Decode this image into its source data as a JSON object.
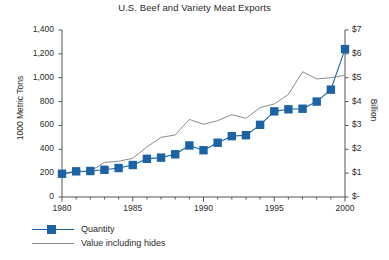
{
  "chart_data": {
    "type": "line",
    "title": "U.S. Beef and Variety Meat Exports",
    "xlabel": "",
    "ylabel": "1000 Metric Tons",
    "y2label": "Billion",
    "x": [
      1980,
      1981,
      1982,
      1983,
      1984,
      1985,
      1986,
      1987,
      1988,
      1989,
      1990,
      1991,
      1992,
      1993,
      1994,
      1995,
      1996,
      1997,
      1998,
      1999,
      2000
    ],
    "xlim": [
      1980,
      2000
    ],
    "xticks": [
      1980,
      1985,
      1990,
      1995,
      2000
    ],
    "xticklabels": [
      "1980",
      "1985",
      "1990",
      "1995",
      "2000"
    ],
    "x_minor_ticks_every": 1,
    "ylim": [
      0,
      1400
    ],
    "yticks": [
      0,
      200,
      400,
      600,
      800,
      1000,
      1200,
      1400
    ],
    "yticklabels": [
      "0",
      "200",
      "400",
      "600",
      "800",
      "1,000",
      "1,200",
      "1,400"
    ],
    "y2lim": [
      0,
      7
    ],
    "y2ticks": [
      0,
      1,
      2,
      3,
      4,
      5,
      6,
      7
    ],
    "y2ticklabels": [
      "$-",
      "$1",
      "$2",
      "$3",
      "$4",
      "$5",
      "$6",
      "$7"
    ],
    "grid": false,
    "legend_position": "below-left",
    "series": [
      {
        "name": "Quantity",
        "axis": "left",
        "color": "#1b63a5",
        "marker": "square",
        "values": [
          195,
          215,
          218,
          228,
          243,
          268,
          320,
          330,
          358,
          432,
          392,
          455,
          510,
          518,
          605,
          718,
          735,
          740,
          800,
          900,
          1240
        ]
      },
      {
        "name": "Value including hides",
        "axis": "right",
        "color": "#8c8c8c",
        "marker": "none",
        "values": [
          0.95,
          1.05,
          1.08,
          1.45,
          1.5,
          1.62,
          2.1,
          2.5,
          2.6,
          3.25,
          3.05,
          3.2,
          3.45,
          3.3,
          3.75,
          3.9,
          4.3,
          5.25,
          4.95,
          5.0,
          5.1
        ]
      }
    ]
  },
  "legend": {
    "items": [
      {
        "label": "Quantity",
        "style": "line-marker",
        "color": "#1b63a5"
      },
      {
        "label": "Value including hides",
        "style": "line",
        "color": "#8c8c8c"
      }
    ]
  },
  "colors": {
    "quantity": "#1b63a5",
    "value_line": "#8c8c8c",
    "axis": "#555555",
    "text": "#2b2b2b",
    "background": "#ffffff"
  }
}
